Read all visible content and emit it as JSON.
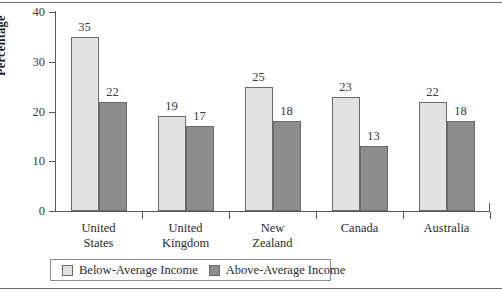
{
  "chart_data": {
    "type": "bar",
    "title": "",
    "xlabel": "",
    "ylabel": "Percentage",
    "ylim": [
      0,
      40
    ],
    "yticks": [
      0,
      10,
      20,
      30,
      40
    ],
    "ytick_labels": [
      "0",
      "10",
      "20",
      "30",
      "40"
    ],
    "grid": false,
    "legend_position": "bottom-left",
    "categories": [
      "United States",
      "United Kingdom",
      "New Zealand",
      "Canada",
      "Australia"
    ],
    "category_lines": [
      [
        "United",
        "States"
      ],
      [
        "United",
        "Kingdom"
      ],
      [
        "New",
        "Zealand"
      ],
      [
        "Canada"
      ],
      [
        "Australia"
      ]
    ],
    "series": [
      {
        "name": "Below-Average Income",
        "color": "#e2e2e2",
        "values": [
          35,
          19,
          25,
          23,
          22
        ],
        "labels": [
          "35",
          "19",
          "25",
          "23",
          "22"
        ]
      },
      {
        "name": "Above-Average Income",
        "color": "#8d8d8d",
        "values": [
          22,
          17,
          18,
          13,
          18
        ],
        "labels": [
          "22",
          "17",
          "18",
          "13",
          "18"
        ]
      }
    ]
  },
  "legend": {
    "items": [
      {
        "label": "Below-Average Income",
        "swatch": "light"
      },
      {
        "label": "Above-Average Income",
        "swatch": "dark"
      }
    ]
  }
}
